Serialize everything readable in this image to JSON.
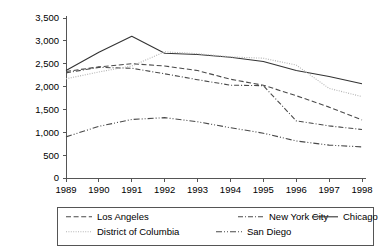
{
  "chart_data": {
    "type": "line",
    "title": "",
    "subtitle": "",
    "xlabel": "",
    "ylabel": "",
    "x": [
      1989,
      1990,
      1991,
      1992,
      1993,
      1994,
      1995,
      1996,
      1997,
      1998
    ],
    "categories": [
      "1989",
      "1990",
      "1991",
      "1992",
      "1993",
      "1994",
      "1995",
      "1996",
      "1997",
      "1998"
    ],
    "xlim": [
      1989,
      1998
    ],
    "ylim": [
      0,
      3500
    ],
    "ytick_values": [
      0,
      500,
      1000,
      1500,
      2000,
      2500,
      3000,
      3500
    ],
    "ytick_labels": [
      "0",
      "500",
      "1,000",
      "1,500",
      "2,000",
      "2,500",
      "3,000",
      "3,500"
    ],
    "grid": false,
    "legend_position": "below",
    "series": [
      {
        "name": "Los Angeles",
        "dash": "dashed",
        "color": "#4a4a4a",
        "values": [
          2330,
          2430,
          2500,
          2450,
          2350,
          2160,
          2030,
          1800,
          1550,
          1270
        ]
      },
      {
        "name": "New York City",
        "dash": "dash-dot",
        "color": "#4a4a4a",
        "values": [
          2300,
          2420,
          2400,
          2280,
          2150,
          2030,
          2020,
          1250,
          1140,
          1060
        ]
      },
      {
        "name": "Chicago",
        "dash": "solid",
        "color": "#333333",
        "values": [
          2350,
          2750,
          3100,
          2730,
          2700,
          2640,
          2550,
          2350,
          2220,
          2060
        ]
      },
      {
        "name": "District of Columbia",
        "dash": "dotted",
        "color": "#b4b4b4",
        "values": [
          2170,
          2320,
          2450,
          2760,
          2720,
          2650,
          2620,
          2470,
          1960,
          1780
        ]
      },
      {
        "name": "San Diego",
        "dash": "dash-dot-dot",
        "color": "#4a4a4a",
        "values": [
          900,
          1130,
          1280,
          1320,
          1230,
          1100,
          980,
          810,
          720,
          680
        ]
      }
    ],
    "legend_entries": [
      {
        "label": "Los Angeles",
        "row": 0,
        "col": 0
      },
      {
        "label": "New York City",
        "row": 0,
        "col": 1
      },
      {
        "label": "Chicago",
        "row": 0,
        "col": 2
      },
      {
        "label": "District of Columbia",
        "row": 1,
        "col": 0
      },
      {
        "label": "San Diego",
        "row": 1,
        "col": 1
      }
    ]
  }
}
